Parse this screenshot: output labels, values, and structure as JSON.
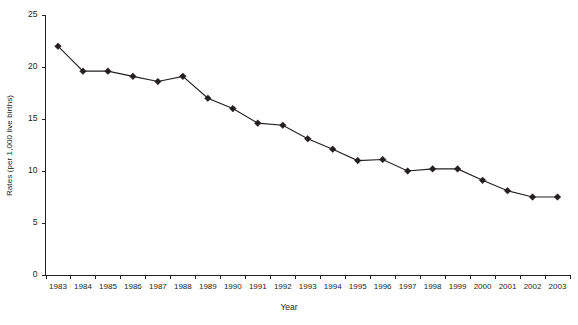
{
  "chart_data": {
    "type": "line",
    "title": "",
    "xlabel": "Year",
    "ylabel": "Rates (per 1,000 live births)",
    "categories": [
      "1983",
      "1984",
      "1985",
      "1986",
      "1987",
      "1988",
      "1989",
      "1990",
      "1991",
      "1992",
      "1993",
      "1994",
      "1995",
      "1996",
      "1997",
      "1998",
      "1999",
      "2000",
      "2001",
      "2002",
      "2003"
    ],
    "values": [
      22.0,
      19.6,
      19.6,
      19.1,
      18.6,
      19.1,
      17.0,
      16.0,
      14.6,
      14.4,
      13.1,
      12.1,
      11.0,
      11.1,
      10.0,
      10.2,
      10.2,
      9.1,
      8.1,
      7.5,
      7.5
    ],
    "x": [
      1983,
      1984,
      1985,
      1986,
      1987,
      1988,
      1989,
      1990,
      1991,
      1992,
      1993,
      1994,
      1995,
      1996,
      1997,
      1998,
      1999,
      2000,
      2001,
      2002,
      2003
    ],
    "ylim": [
      0,
      25
    ],
    "yticks": [
      0,
      5,
      10,
      15,
      20,
      25
    ],
    "ytick_labels": [
      "0",
      "5",
      "10",
      "15",
      "20",
      "25"
    ],
    "grid": false,
    "legend": null,
    "marker": "diamond",
    "series_color": "#231f20"
  },
  "axes": {
    "y_title": "Rates (per 1,000 live births)",
    "x_title": "Year"
  },
  "colors": {
    "ink": "#231f20",
    "background": "#ffffff"
  }
}
